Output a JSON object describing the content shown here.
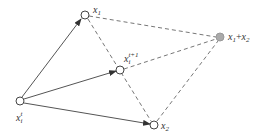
{
  "diagram": {
    "type": "vector-diagram",
    "colors": {
      "line": "#555555",
      "dashed": "#777777",
      "node_fill": "#ffffff",
      "sum_node_fill": "#aaaaaa"
    },
    "nodes": [
      {
        "id": "xit",
        "base": "x",
        "sub": "i",
        "sup": "t",
        "cx": 20,
        "cy": 101
      },
      {
        "id": "x1",
        "base": "x",
        "sub": "1",
        "sup": "",
        "cx": 85,
        "cy": 15
      },
      {
        "id": "xit1",
        "base": "x",
        "sub": "i",
        "sup": "t+1",
        "cx": 120,
        "cy": 70
      },
      {
        "id": "x2",
        "base": "x",
        "sub": "2",
        "sup": "",
        "cx": 154,
        "cy": 125
      },
      {
        "id": "sum",
        "label": "x1+x2",
        "cx": 220,
        "cy": 37
      }
    ],
    "labels": {
      "xit": {
        "base": "x",
        "sub": "i",
        "sup": "t"
      },
      "x1": {
        "base": "x",
        "sub": "1"
      },
      "xit1": {
        "base": "x",
        "sub": "i",
        "sup": "t+1"
      },
      "x2": {
        "base": "x",
        "sub": "2"
      },
      "sum": {
        "a_base": "x",
        "a_sub": "1",
        "op": "+",
        "b_base": "x",
        "b_sub": "2"
      }
    },
    "edges": [
      {
        "from": "xit",
        "to": "x1",
        "style": "solid-arrow"
      },
      {
        "from": "xit",
        "to": "xit1",
        "style": "solid-arrow"
      },
      {
        "from": "xit",
        "to": "x2",
        "style": "solid-arrow"
      },
      {
        "from": "x1",
        "to": "sum",
        "style": "dashed"
      },
      {
        "from": "x1",
        "to": "x2",
        "style": "dashed"
      },
      {
        "from": "xit1",
        "to": "sum",
        "style": "dashed"
      },
      {
        "from": "x2",
        "to": "sum",
        "style": "dashed"
      }
    ]
  }
}
